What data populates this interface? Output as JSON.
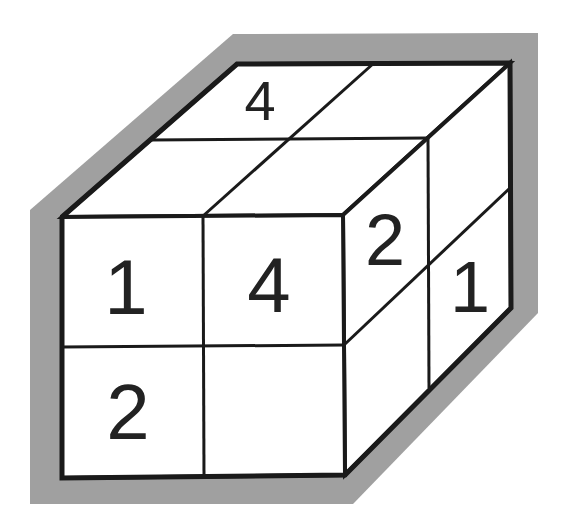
{
  "diagram": {
    "title": "",
    "colors": {
      "background": "#ffffff",
      "shadow": "#a0a0a0",
      "face": "#ffffff",
      "line": "#1a1a1a",
      "text": "#222222"
    },
    "labels": {
      "top_back_left": "4",
      "front_top_left": "1",
      "front_top_right": "4",
      "front_bottom_left": "2",
      "front_bottom_right": "",
      "right_top_front": "2",
      "right_top_back": "1",
      "right_bottom_front": "",
      "right_bottom_back": ""
    }
  }
}
